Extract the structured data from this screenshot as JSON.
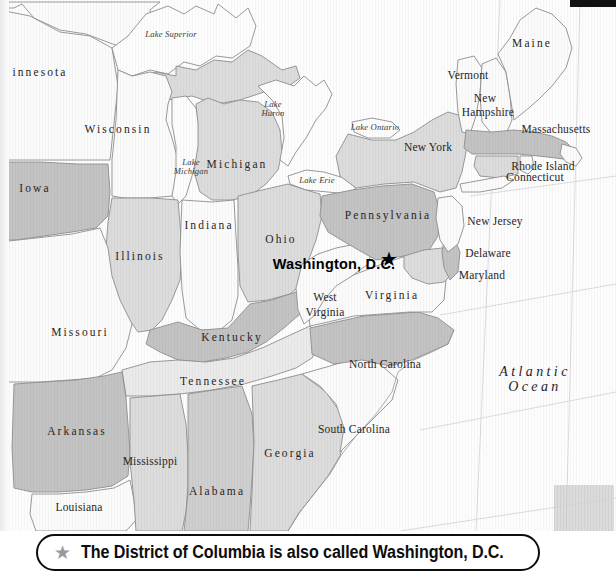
{
  "map": {
    "title_region": "Eastern United States",
    "states": [
      {
        "name": "innesota",
        "x": 40,
        "y": 72,
        "style": "state",
        "fill": "#fbfbfb"
      },
      {
        "name": "Wisconsin",
        "x": 118,
        "y": 129,
        "style": "state",
        "fill": "#fbfbfb"
      },
      {
        "name": "Michigan",
        "x": 237,
        "y": 164,
        "style": "state",
        "fill": "#dcdcdc"
      },
      {
        "name": "Iowa",
        "x": 35,
        "y": 188,
        "style": "state",
        "fill": "#c3c3c3"
      },
      {
        "name": "Illinois",
        "x": 140,
        "y": 256,
        "style": "state",
        "fill": "#dcdcdc"
      },
      {
        "name": "Indiana",
        "x": 209,
        "y": 225,
        "style": "state",
        "fill": "#fbfbfb"
      },
      {
        "name": "Ohio",
        "x": 281,
        "y": 239,
        "style": "state",
        "fill": "#dcdcdc"
      },
      {
        "name": "Missouri",
        "x": 80,
        "y": 332,
        "style": "state",
        "fill": "#fbfbfb"
      },
      {
        "name": "Kentucky",
        "x": 232,
        "y": 337,
        "style": "state",
        "fill": "#c3c3c3"
      },
      {
        "name": "Tennessee",
        "x": 213,
        "y": 381,
        "style": "state",
        "fill": "#eaeaea"
      },
      {
        "name": "Arkansas",
        "x": 77,
        "y": 431,
        "style": "state",
        "fill": "#c3c3c3"
      },
      {
        "name": "Mississippi",
        "x": 150,
        "y": 461,
        "style": "state-tight",
        "fill": "#dcdcdc"
      },
      {
        "name": "Alabama",
        "x": 217,
        "y": 491,
        "style": "state",
        "fill": "#cfcfcf"
      },
      {
        "name": "Louisiana",
        "x": 79,
        "y": 507,
        "style": "state-tight",
        "fill": "#fbfbfb"
      },
      {
        "name": "Georgia",
        "x": 290,
        "y": 453,
        "style": "state",
        "fill": "#dcdcdc"
      },
      {
        "name": "South Carolina",
        "x": 354,
        "y": 429,
        "style": "state-tight",
        "fill": "#fbfbfb"
      },
      {
        "name": "North Carolina",
        "x": 385,
        "y": 364,
        "style": "state-tight",
        "fill": "#c3c3c3"
      },
      {
        "name": "Virginia",
        "x": 392,
        "y": 295,
        "style": "state",
        "fill": "#fbfbfb"
      },
      {
        "name": "West",
        "x": 325,
        "y": 297,
        "style": "state-tight",
        "fill": "#fbfbfb"
      },
      {
        "name": "Virginia",
        "x": 325,
        "y": 312,
        "style": "state-tight",
        "fill": "#fbfbfb"
      },
      {
        "name": "Pennsylvania",
        "x": 388,
        "y": 215,
        "style": "state",
        "fill": "#c3c3c3"
      },
      {
        "name": "New York",
        "x": 428,
        "y": 147,
        "style": "state-tight",
        "fill": "#dcdcdc"
      },
      {
        "name": "Vermont",
        "x": 468,
        "y": 75,
        "style": "state-tight",
        "fill": "#fbfbfb"
      },
      {
        "name": "New",
        "x": 485,
        "y": 98,
        "style": "state-tight",
        "fill": "#fbfbfb"
      },
      {
        "name": "Hampshire",
        "x": 488,
        "y": 112,
        "style": "state-tight",
        "fill": "#fbfbfb"
      },
      {
        "name": "Maine",
        "x": 532,
        "y": 43,
        "style": "state",
        "fill": "#fbfbfb"
      },
      {
        "name": "Massachusetts",
        "x": 556,
        "y": 129,
        "style": "state-tight",
        "fill": "#c3c3c3"
      },
      {
        "name": "Rhode Island",
        "x": 543,
        "y": 166,
        "style": "state-tight",
        "fill": "#fbfbfb"
      },
      {
        "name": "Connecticut",
        "x": 535,
        "y": 177,
        "style": "state-tight",
        "fill": "#dcdcdc"
      },
      {
        "name": "New Jersey",
        "x": 495,
        "y": 221,
        "style": "state-tight",
        "fill": "#fbfbfb"
      },
      {
        "name": "Delaware",
        "x": 488,
        "y": 253,
        "style": "state-tight",
        "fill": "#c3c3c3"
      },
      {
        "name": "Maryland",
        "x": 482,
        "y": 275,
        "style": "state-tight",
        "fill": "#dcdcdc"
      }
    ],
    "lakes": [
      {
        "name": "Lake Superior",
        "x": 171,
        "y": 35,
        "lines": [
          "Lake Superior"
        ]
      },
      {
        "name": "Lake Huron",
        "x": 273,
        "y": 109,
        "lines": [
          "Lake",
          "Huron"
        ]
      },
      {
        "name": "Lake Michigan",
        "x": 191,
        "y": 167,
        "lines": [
          "Lake",
          "Michigan"
        ]
      },
      {
        "name": "Lake Ontario",
        "x": 375,
        "y": 128,
        "lines": [
          "Lake Ontario"
        ]
      },
      {
        "name": "Lake Erie",
        "x": 317,
        "y": 181,
        "lines": [
          "Lake Erie"
        ]
      }
    ],
    "ocean": {
      "line1": "Atlantic",
      "line2": "Ocean",
      "x": 535,
      "y": 380
    },
    "capital": {
      "label": "Washington, D.C.",
      "label_x": 334,
      "label_y": 265,
      "star_x": 389,
      "star_y": 259,
      "star_glyph": "★"
    },
    "colors": {
      "fill_white": "#fbfbfb",
      "fill_light": "#eaeaea",
      "fill_mid": "#dcdcdc",
      "fill_dark": "#c3c3c3",
      "stroke": "#8e8e8e",
      "graticule": "#d8d8d8",
      "text": "#262626"
    }
  },
  "caption": {
    "star_glyph": "★",
    "text": "The District of Columbia is also called Washington, D.C."
  }
}
